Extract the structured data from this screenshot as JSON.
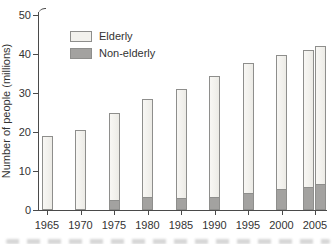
{
  "chart_data": {
    "type": "bar",
    "stacked": true,
    "title": "",
    "xlabel": "",
    "ylabel": "Number of people (millions)",
    "ylim": [
      0,
      50
    ],
    "yticks": [
      0,
      10,
      20,
      30,
      40,
      50
    ],
    "xticks": [
      1965,
      1970,
      1975,
      1980,
      1985,
      1990,
      1995,
      2000,
      2005
    ],
    "x": [
      1965,
      1970,
      1975,
      1980,
      1985,
      1990,
      1995,
      2000,
      2004,
      2005
    ],
    "series": [
      {
        "name": "Elderly",
        "values": [
          19.1,
          20.5,
          22.7,
          25.5,
          28.1,
          31.1,
          33.6,
          34.7,
          35.3,
          35.5
        ]
      },
      {
        "name": "Non-elderly",
        "values": [
          0,
          0,
          2.3,
          3.0,
          2.9,
          3.2,
          4.0,
          5.0,
          5.7,
          6.5
        ]
      }
    ],
    "totals": [
      19.1,
      20.5,
      25.0,
      28.5,
      31.0,
      34.3,
      37.6,
      39.7,
      41.0,
      42.0
    ],
    "grid": false,
    "legend": {
      "position": "upper-left-inside",
      "entries": [
        "Elderly",
        "Non-elderly"
      ]
    },
    "layout_hints": {
      "last_two_bars_adjacent": true,
      "bottom_text_line_cropped": true
    },
    "colors": {
      "elderly_fill": "#f2f1ed",
      "non_elderly_fill": "#a3a2a0",
      "bar_border": "#8e8e8c",
      "axis": "#4a4a4a",
      "text": "#333333"
    }
  }
}
